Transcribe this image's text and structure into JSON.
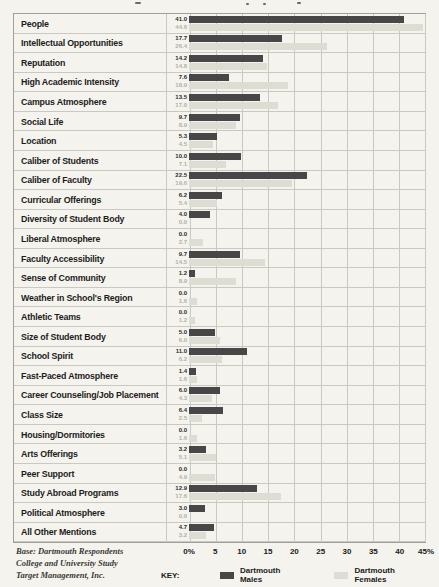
{
  "chart_data": {
    "type": "bar",
    "orientation": "horizontal",
    "title": "",
    "xlabel": "",
    "xlim": [
      0,
      45
    ],
    "grid": true,
    "legend_position": "bottom",
    "key_label": "KEY:",
    "ticks": [
      "0%",
      "5",
      "10",
      "15",
      "20",
      "25",
      "30",
      "35",
      "40",
      "45%"
    ],
    "categories": [
      "People",
      "Intellectual Opportunities",
      "Reputation",
      "High Academic Intensity",
      "Campus Atmosphere",
      "Social Life",
      "Location",
      "Caliber of Students",
      "Caliber of Faculty",
      "Curricular Offerings",
      "Diversity of Student Body",
      "Liberal Atmosphere",
      "Faculty Accessibility",
      "Sense of Community",
      "Weather in School's Region",
      "Athletic Teams",
      "Size of Student Body",
      "School Spirit",
      "Fast-Paced Atmosphere",
      "Career Counseling/Job Placement",
      "Class Size",
      "Housing/Dormitories",
      "Arts Offerings",
      "Peer Support",
      "Study Abroad Programs",
      "Political Atmosphere",
      "All Other Mentions"
    ],
    "series": [
      {
        "name": "Dartmouth Males",
        "color": "#474747",
        "values": [
          41.0,
          17.7,
          14.2,
          7.6,
          13.5,
          9.7,
          5.3,
          10.0,
          22.5,
          6.2,
          4.0,
          0.0,
          9.7,
          1.2,
          0.0,
          0.0,
          5.0,
          11.0,
          1.4,
          6.0,
          6.4,
          0.0,
          3.2,
          0.0,
          12.9,
          3.0,
          4.7
        ]
      },
      {
        "name": "Dartmouth Females",
        "color": "#deddd4",
        "values": [
          44.6,
          26.4,
          14.8,
          18.9,
          17.0,
          8.9,
          4.5,
          7.1,
          19.6,
          5.4,
          0.0,
          2.7,
          14.5,
          8.9,
          1.6,
          1.2,
          6.0,
          6.2,
          1.6,
          4.3,
          2.5,
          1.6,
          5.1,
          4.9,
          17.6,
          0.0,
          3.2
        ]
      }
    ]
  },
  "footer": {
    "base_lines": [
      "Base: Dartmouth Respondents",
      "College and University Study",
      "Target Management, Inc."
    ]
  },
  "colors": {
    "background": "#f5f3ed",
    "male_bar": "#474747",
    "female_bar": "#deddd4",
    "grid_line": "#c9c8c1",
    "frame_border": "#a29f97",
    "label_text": "#1c1c1c",
    "male_value_text": "#2b2b2b",
    "female_value_text": "#b3b1a8",
    "footer_text": "#3a3a38"
  }
}
